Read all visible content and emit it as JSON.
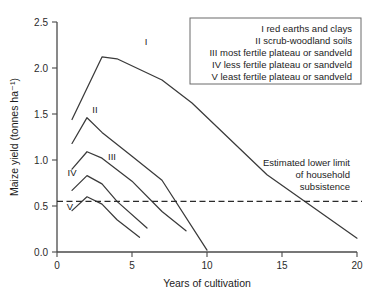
{
  "chart_data": {
    "type": "line",
    "title": "",
    "xlabel": "Years of cultivation",
    "ylabel": "Maize yield (tonnes ha⁻¹)",
    "xlim": [
      0,
      20
    ],
    "ylim": [
      0.0,
      2.5
    ],
    "grid": false,
    "xticks": [
      "0",
      "5",
      "10",
      "15",
      "20"
    ],
    "xtick_values": [
      0,
      5,
      10,
      15,
      20
    ],
    "yticks": [
      "0.0",
      "0.5",
      "1.0",
      "1.5",
      "2.0",
      "2.5"
    ],
    "ytick_values": [
      0.0,
      0.5,
      1.0,
      1.5,
      2.0,
      2.5
    ],
    "series": [
      {
        "name": "I",
        "label": "I",
        "x": [
          1,
          3,
          4,
          7,
          9,
          14,
          20
        ],
        "values": [
          1.44,
          2.12,
          2.1,
          1.87,
          1.62,
          0.84,
          0.15
        ]
      },
      {
        "name": "II",
        "label": "II",
        "x": [
          1,
          2,
          3,
          5,
          7,
          10
        ],
        "values": [
          1.18,
          1.46,
          1.3,
          1.04,
          0.78,
          0.02
        ]
      },
      {
        "name": "III",
        "label": "III",
        "x": [
          1,
          2,
          3,
          5,
          7,
          8.6
        ],
        "values": [
          0.9,
          1.09,
          1.02,
          0.77,
          0.44,
          0.23
        ]
      },
      {
        "name": "IV",
        "label": "IV",
        "x": [
          1,
          2,
          3,
          4,
          6
        ],
        "values": [
          0.67,
          0.83,
          0.74,
          0.55,
          0.26
        ]
      },
      {
        "name": "V",
        "label": "V",
        "x": [
          1,
          2,
          3,
          4,
          5.5
        ],
        "values": [
          0.45,
          0.6,
          0.52,
          0.35,
          0.16
        ]
      }
    ],
    "threshold": {
      "value": 0.55,
      "style": "dashed",
      "annotation": [
        "Estimated lower limit",
        "of household",
        "subsistence"
      ]
    },
    "legend": {
      "position": "top-right",
      "entries": [
        "I red earths and clays",
        "II scrub-woodland soils",
        "III most fertile plateau or sandveld",
        "IV less fertile plateau or sandveld",
        "V least fertile plateau or sandveld"
      ]
    }
  }
}
